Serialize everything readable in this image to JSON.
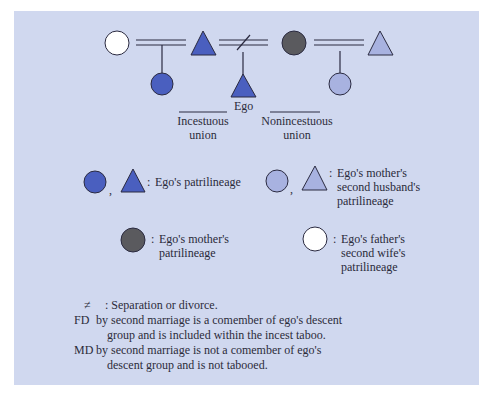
{
  "colors": {
    "background": "#d0d8ef",
    "ego_patrilineage": "#4a5fbf",
    "mother_second_husband_patrilineage": "#a8b2e0",
    "mother_patrilineage": "#5a5a5e",
    "father_second_wife_patrilineage": "#ffffff",
    "stroke": "#2a2a40"
  },
  "diagram": {
    "ego_label": "Ego",
    "incestuous_label_line1": "Incestuous",
    "incestuous_label_line2": "union",
    "nonincestuous_label_line1": "Nonincestuous",
    "nonincestuous_label_line2": "union"
  },
  "legend": [
    {
      "symbols": "circle, triangle",
      "color": "ego_patrilineage",
      "lines": [
        "Ego's patrilineage"
      ]
    },
    {
      "symbols": "circle, triangle",
      "color": "mother_second_husband_patrilineage",
      "lines": [
        "Ego's mother's",
        "second husband's",
        "patrilineage"
      ]
    },
    {
      "symbols": "circle",
      "color": "mother_patrilineage",
      "lines": [
        "Ego's mother's",
        "patrilineage"
      ]
    },
    {
      "symbols": "circle",
      "color": "father_second_wife_patrilineage",
      "lines": [
        "Ego's father's",
        "second wife's",
        "patrilineage"
      ]
    }
  ],
  "notes": {
    "line1_symbol": "≠",
    "line1_text": ": Separation or divorce.",
    "line2_prefix": "FD",
    "line2_text": "by second marriage is a comember of ego's descent",
    "line3_text": "group and is included within the incest taboo.",
    "line4_prefix": "MD",
    "line4_text": "by second marriage is not a comember of ego's",
    "line5_text": "descent group and is not tabooed."
  }
}
